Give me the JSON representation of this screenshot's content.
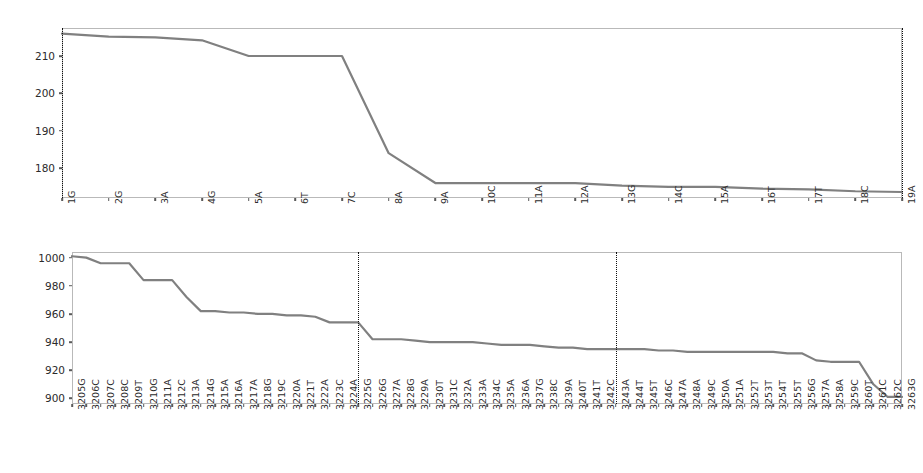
{
  "figure": {
    "width": 923,
    "height": 473,
    "background": "#ffffff",
    "line_color": "#808080",
    "axis_color": "#b9b9b9",
    "tick_color": "#5a5a5a",
    "vline_color": "#111111"
  },
  "chart_data": [
    {
      "type": "line",
      "panel": "top",
      "title": "",
      "xlabel": "",
      "ylabel": "",
      "grid": false,
      "legend": "none",
      "ylim": [
        172.0,
        217.5
      ],
      "yticks": [
        180,
        190,
        200,
        210
      ],
      "ytick_labels": [
        "180",
        "190",
        "200",
        "210"
      ],
      "categories": [
        "1G",
        "2G",
        "3A",
        "4G",
        "5A",
        "6T",
        "7C",
        "8A",
        "9A",
        "10C",
        "11A",
        "12A",
        "13G",
        "14C",
        "15A",
        "16T",
        "17T",
        "18C",
        "19A"
      ],
      "values": [
        216.0,
        215.2,
        215.0,
        214.2,
        210.0,
        210.0,
        210.0,
        184.0,
        176.0,
        176.0,
        176.0,
        176.0,
        175.3,
        175.0,
        175.0,
        174.5,
        174.3,
        173.8,
        173.6
      ],
      "annotations": [
        {
          "type": "vline",
          "style": "dotted",
          "at_category": "1G"
        },
        {
          "type": "vline",
          "style": "dotted",
          "at_category": "19A"
        }
      ]
    },
    {
      "type": "line",
      "panel": "bottom",
      "title": "",
      "xlabel": "",
      "ylabel": "",
      "grid": false,
      "legend": "none",
      "ylim": [
        896,
        1004
      ],
      "yticks": [
        900,
        920,
        940,
        960,
        980,
        1000
      ],
      "ytick_labels": [
        "900",
        "920",
        "940",
        "960",
        "980",
        "1000"
      ],
      "categories": [
        "3205G",
        "3206C",
        "3207C",
        "3208C",
        "3209T",
        "3210G",
        "3211A",
        "3212C",
        "3213A",
        "3214G",
        "3215A",
        "3216A",
        "3217A",
        "3218G",
        "3219C",
        "3220A",
        "3221T",
        "3222A",
        "3223C",
        "3224A",
        "3225G",
        "3226G",
        "3227A",
        "3228G",
        "3229A",
        "3230T",
        "3231C",
        "3232A",
        "3233A",
        "3234C",
        "3235A",
        "3236A",
        "3237G",
        "3238C",
        "3239A",
        "3240T",
        "3241T",
        "3242C",
        "3243A",
        "3244T",
        "3245T",
        "3246C",
        "3247A",
        "3248A",
        "3249C",
        "3250A",
        "3251A",
        "3252T",
        "3253T",
        "3254T",
        "3255T",
        "3256G",
        "3257A",
        "3258A",
        "3259C",
        "3260T",
        "3261C",
        "3262C",
        "3263G"
      ],
      "values": [
        1001,
        1000,
        996,
        996,
        996,
        984,
        984,
        984,
        972,
        962,
        962,
        961,
        961,
        960,
        960,
        959,
        959,
        958,
        954,
        954,
        954,
        942,
        942,
        942,
        941,
        940,
        940,
        940,
        940,
        939,
        938,
        938,
        938,
        937,
        936,
        936,
        935,
        935,
        935,
        935,
        935,
        934,
        934,
        933,
        933,
        933,
        933,
        933,
        933,
        933,
        932,
        932,
        927,
        926,
        926,
        926,
        910,
        901,
        901
      ],
      "annotations": [
        {
          "type": "vline",
          "style": "dotted",
          "at_category": "3225G"
        },
        {
          "type": "vline",
          "style": "dotted",
          "at_category": "3243A"
        }
      ]
    }
  ]
}
